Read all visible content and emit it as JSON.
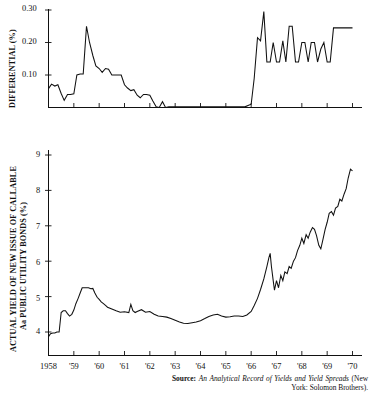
{
  "figure": {
    "background_color": "#ffffff",
    "ink_color": "#111111",
    "width": 370,
    "height": 401
  },
  "source": {
    "label": "Source:",
    "title": "An Analytical Record of Yields and Yield Spreads",
    "rest": "(New York: Solomon Brothers)."
  },
  "chart_data": [
    {
      "type": "line",
      "id": "differential-panel",
      "title": "",
      "ylabel": "DIFFERENTIAL (%)",
      "xlabel": "",
      "ylim": [
        0.0,
        0.3
      ],
      "ytick_labels": [
        "0.30",
        "0.20",
        "0.10"
      ],
      "ytick_values": [
        0.3,
        0.2,
        0.1
      ],
      "grid": false,
      "legend": "none",
      "xlim": [
        1958.0,
        1970.0
      ],
      "xtick_labels": [
        "1958",
        "'59",
        "'60",
        "'61",
        "'62",
        "'63",
        "'64",
        "'65",
        "'66",
        "'67",
        "'68",
        "'69",
        "'70"
      ],
      "xtick_values": [
        1958,
        1959,
        1960,
        1961,
        1962,
        1963,
        1964,
        1965,
        1966,
        1967,
        1968,
        1969,
        1970
      ],
      "series": [
        {
          "name": "Differential between callable and non-callable new issue yields",
          "x": [
            1958.0,
            1958.12,
            1958.25,
            1958.37,
            1958.5,
            1958.62,
            1958.75,
            1958.87,
            1959.0,
            1959.12,
            1959.25,
            1959.37,
            1959.5,
            1959.62,
            1959.75,
            1959.87,
            1960.0,
            1960.12,
            1960.25,
            1960.37,
            1960.5,
            1960.62,
            1960.75,
            1960.87,
            1961.0,
            1961.12,
            1961.25,
            1961.37,
            1961.5,
            1961.62,
            1961.75,
            1961.87,
            1962.0,
            1962.12,
            1962.25,
            1962.37,
            1962.5,
            1962.62,
            1962.75,
            1962.87,
            1963.0,
            1963.25,
            1963.5,
            1963.75,
            1964.0,
            1964.25,
            1964.5,
            1964.75,
            1965.0,
            1965.25,
            1965.5,
            1965.75,
            1966.0,
            1966.12,
            1966.25,
            1966.37,
            1966.5,
            1966.62,
            1966.75,
            1966.87,
            1967.0,
            1967.12,
            1967.25,
            1967.37,
            1967.5,
            1967.62,
            1967.75,
            1967.87,
            1968.0,
            1968.12,
            1968.25,
            1968.37,
            1968.5,
            1968.62,
            1968.75,
            1968.87,
            1969.0,
            1969.12,
            1969.25,
            1969.37,
            1969.5,
            1969.62,
            1969.75,
            1969.87,
            1970.0
          ],
          "y": [
            0.058,
            0.072,
            0.066,
            0.07,
            0.043,
            0.022,
            0.04,
            0.04,
            0.042,
            0.1,
            0.103,
            0.103,
            0.25,
            0.2,
            0.16,
            0.128,
            0.12,
            0.108,
            0.12,
            0.118,
            0.1,
            0.1,
            0.1,
            0.1,
            0.07,
            0.06,
            0.052,
            0.055,
            0.038,
            0.03,
            0.04,
            0.04,
            0.038,
            0.02,
            0.002,
            0.0,
            0.018,
            0.0,
            0.002,
            0.002,
            0.002,
            0.002,
            0.002,
            0.002,
            0.002,
            0.002,
            0.002,
            0.002,
            0.002,
            0.002,
            0.002,
            0.002,
            0.01,
            0.09,
            0.215,
            0.205,
            0.295,
            0.14,
            0.14,
            0.2,
            0.14,
            0.14,
            0.205,
            0.14,
            0.25,
            0.25,
            0.14,
            0.14,
            0.2,
            0.2,
            0.14,
            0.2,
            0.2,
            0.14,
            0.18,
            0.2,
            0.14,
            0.14,
            0.245,
            0.245,
            0.245,
            0.245,
            0.245,
            0.245,
            0.245
          ]
        }
      ]
    },
    {
      "type": "line",
      "id": "yield-panel",
      "title": "",
      "ylabel": "ACTUAL YIELD OF NEW ISSUE OF CALLABLE Aa PUBLIC UTILITY BONDS (%)",
      "ylabel_line1": "ACTUAL YIELD OF NEW ISSUE OF CALLABLE",
      "ylabel_line2": "Aa PUBLIC UTILITY BONDS (%)",
      "xlabel": "",
      "ylim": [
        3.5,
        9.5
      ],
      "ytick_labels": [
        "9",
        "8",
        "7",
        "6",
        "5",
        "4"
      ],
      "ytick_values": [
        9,
        8,
        7,
        6,
        5,
        4
      ],
      "grid": false,
      "legend": "none",
      "xlim": [
        1958.0,
        1970.0
      ],
      "xtick_labels": [
        "1958",
        "'59",
        "'60",
        "'61",
        "'62",
        "'63",
        "'64",
        "'65",
        "'66",
        "'67",
        "'68",
        "'69",
        "'70"
      ],
      "xtick_values": [
        1958,
        1959,
        1960,
        1961,
        1962,
        1963,
        1964,
        1965,
        1966,
        1967,
        1968,
        1969,
        1970
      ],
      "series": [
        {
          "name": "Actual yield of new issue of callable Aa public utility bonds",
          "x": [
            1958.0,
            1958.08,
            1958.17,
            1958.25,
            1958.33,
            1958.42,
            1958.5,
            1958.58,
            1958.67,
            1958.75,
            1958.83,
            1958.92,
            1959.0,
            1959.08,
            1959.17,
            1959.25,
            1959.33,
            1959.42,
            1959.5,
            1959.58,
            1959.67,
            1959.75,
            1959.83,
            1959.92,
            1960.0,
            1960.08,
            1960.17,
            1960.25,
            1960.33,
            1960.5,
            1960.67,
            1960.83,
            1961.0,
            1961.17,
            1961.25,
            1961.33,
            1961.42,
            1961.5,
            1961.67,
            1961.83,
            1962.0,
            1962.17,
            1962.33,
            1962.5,
            1962.67,
            1962.83,
            1963.0,
            1963.17,
            1963.33,
            1963.5,
            1963.67,
            1963.83,
            1964.0,
            1964.17,
            1964.33,
            1964.5,
            1964.67,
            1964.83,
            1965.0,
            1965.17,
            1965.33,
            1965.5,
            1965.67,
            1965.83,
            1966.0,
            1966.12,
            1966.25,
            1966.37,
            1966.5,
            1966.62,
            1966.7,
            1966.75,
            1966.8,
            1966.87,
            1966.92,
            1967.0,
            1967.08,
            1967.17,
            1967.25,
            1967.33,
            1967.42,
            1967.5,
            1967.58,
            1967.67,
            1967.75,
            1967.83,
            1967.92,
            1968.0,
            1968.08,
            1968.17,
            1968.25,
            1968.33,
            1968.42,
            1968.5,
            1968.58,
            1968.67,
            1968.75,
            1968.83,
            1968.92,
            1969.0,
            1969.08,
            1969.17,
            1969.25,
            1969.33,
            1969.42,
            1969.5,
            1969.58,
            1969.67,
            1969.75,
            1969.83,
            1969.92,
            1970.0
          ],
          "y": [
            3.87,
            3.95,
            3.97,
            3.97,
            4.0,
            4.0,
            4.55,
            4.6,
            4.6,
            4.52,
            4.45,
            4.5,
            4.62,
            4.8,
            4.95,
            5.1,
            5.25,
            5.25,
            5.25,
            5.25,
            5.22,
            5.23,
            5.1,
            4.98,
            4.92,
            4.85,
            4.8,
            4.75,
            4.7,
            4.65,
            4.6,
            4.56,
            4.57,
            4.55,
            4.78,
            4.6,
            4.55,
            4.58,
            4.63,
            4.56,
            4.58,
            4.5,
            4.45,
            4.44,
            4.42,
            4.38,
            4.33,
            4.28,
            4.25,
            4.24,
            4.26,
            4.28,
            4.32,
            4.38,
            4.44,
            4.48,
            4.5,
            4.45,
            4.42,
            4.43,
            4.45,
            4.45,
            4.44,
            4.48,
            4.58,
            4.75,
            4.95,
            5.2,
            5.5,
            5.85,
            6.1,
            6.22,
            5.85,
            5.45,
            5.18,
            5.45,
            5.25,
            5.6,
            5.45,
            5.7,
            5.65,
            5.85,
            5.8,
            6.0,
            6.1,
            6.3,
            6.45,
            6.65,
            6.5,
            6.75,
            6.65,
            6.82,
            6.95,
            6.9,
            6.72,
            6.45,
            6.35,
            6.6,
            6.9,
            7.1,
            7.35,
            7.4,
            7.3,
            7.5,
            7.55,
            7.75,
            7.7,
            7.9,
            8.05,
            8.35,
            8.6,
            8.55
          ]
        }
      ]
    }
  ]
}
